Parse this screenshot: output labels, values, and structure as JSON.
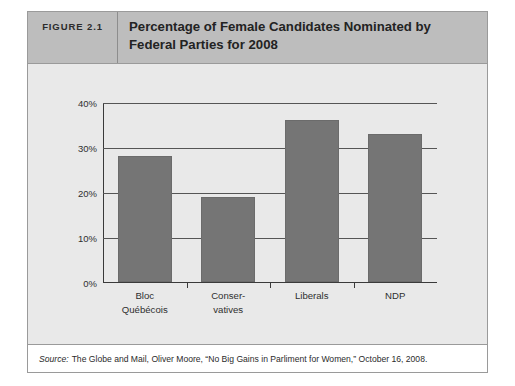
{
  "figure": {
    "number_label": "FIGURE 2.1",
    "title": "Percentage of Female Candidates Nominated by Federal Parties for 2008",
    "source_prefix": "Source:",
    "source_text": "The Globe and Mail, Oliver Moore, “No Big Gains in Parliment for Women,” October 16, 2008."
  },
  "colors": {
    "bar": "#757575",
    "header_band": "#bdbdbd",
    "panel": "#e9e9e9",
    "axis": "#3a3a3a"
  },
  "chart_data": {
    "type": "bar",
    "title": "Percentage of Female Candidates Nominated by Federal Parties for 2008",
    "xlabel": "",
    "ylabel": "",
    "categories": [
      "Bloc Québécois",
      "Conservatives",
      "Liberals",
      "NDP"
    ],
    "category_lines": [
      [
        "Bloc",
        "Québécois"
      ],
      [
        "Conser-",
        "vatives"
      ],
      [
        "Liberals"
      ],
      [
        "NDP"
      ]
    ],
    "values": [
      28,
      19,
      36,
      33
    ],
    "ylim": [
      0,
      40
    ],
    "ytick_values": [
      0,
      10,
      20,
      30,
      40
    ],
    "ytick_labels": [
      "0%",
      "10%",
      "20%",
      "30%",
      "40%"
    ],
    "grid": true,
    "grid_axis": "y",
    "legend": false,
    "legend_position": "none",
    "value_unit": "%"
  }
}
